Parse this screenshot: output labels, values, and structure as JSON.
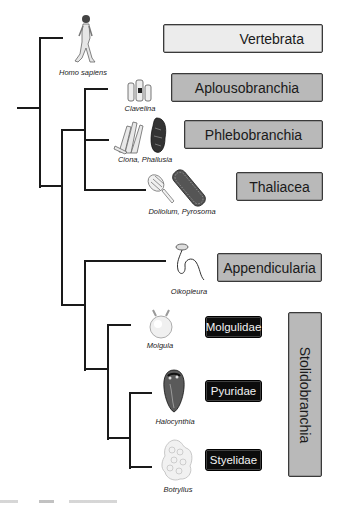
{
  "diagram": {
    "type": "phylogenetic-tree",
    "clades": [
      {
        "id": "vertebrata",
        "label": "Vertebrata",
        "style": "light"
      },
      {
        "id": "aplousobranchia",
        "label": "Aplousobranchia",
        "style": "mid"
      },
      {
        "id": "phlebobranchia",
        "label": "Phlebobranchia",
        "style": "mid"
      },
      {
        "id": "thaliacea",
        "label": "Thaliacea",
        "style": "mid"
      },
      {
        "id": "appendicularia",
        "label": "Appendicularia",
        "style": "mid"
      },
      {
        "id": "stolidobranchia",
        "label": "Stolidobranchia",
        "style": "mid-vertical"
      }
    ],
    "families": [
      {
        "id": "molgulidae",
        "label": "Molgulidae"
      },
      {
        "id": "pyuridae",
        "label": "Pyuridae"
      },
      {
        "id": "styelidae",
        "label": "Styelidae"
      }
    ],
    "taxa": [
      {
        "id": "homo",
        "label": "Homo sapiens",
        "icon": "human-walking-icon"
      },
      {
        "id": "clavelina",
        "label": "Clavelina",
        "icon": "clavelina-icon"
      },
      {
        "id": "ciona",
        "label": "Ciona, Phallusia",
        "icon": "ciona-phallusia-icon"
      },
      {
        "id": "doliolum",
        "label": "Doliolum, Pyrosoma",
        "icon": "doliolum-pyrosoma-icon"
      },
      {
        "id": "oikopleura",
        "label": "Oikopleura",
        "icon": "oikopleura-icon"
      },
      {
        "id": "molgula",
        "label": "Molgula",
        "icon": "molgula-icon"
      },
      {
        "id": "halocynthia",
        "label": "Halocynthia",
        "icon": "halocynthia-icon"
      },
      {
        "id": "botryllus",
        "label": "Botryllus",
        "icon": "botryllus-icon"
      }
    ],
    "colors": {
      "line": "#1a1a1a",
      "light_box": "#ececec",
      "mid_box": "#b9b9b9",
      "dark_box": "#0c0c0c"
    }
  }
}
